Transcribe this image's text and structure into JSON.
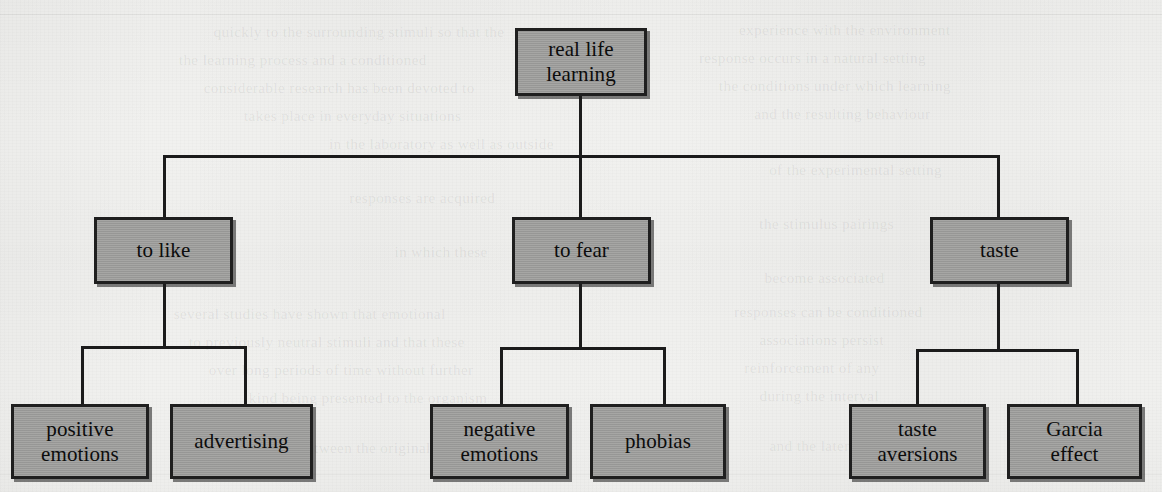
{
  "diagram": {
    "type": "hierarchy-tree",
    "levels": 3,
    "root": {
      "id": "real-life-learning",
      "label": "real life\nlearning"
    },
    "branches": [
      {
        "id": "to-like",
        "label": "to like",
        "children": [
          {
            "id": "positive-emotions",
            "label": "positive\nemotions"
          },
          {
            "id": "advertising",
            "label": "advertising"
          }
        ]
      },
      {
        "id": "to-fear",
        "label": "to fear",
        "children": [
          {
            "id": "negative-emotions",
            "label": "negative\nemotions"
          },
          {
            "id": "phobias",
            "label": "phobias"
          }
        ]
      },
      {
        "id": "taste",
        "label": "taste",
        "children": [
          {
            "id": "taste-aversions",
            "label": "taste\naversions"
          },
          {
            "id": "garcia-effect",
            "label": "Garcia\neffect"
          }
        ]
      }
    ]
  },
  "style": {
    "box_fill": "#9c9c9a",
    "box_border": "#1f1f1f",
    "line_color": "#1b1b1b",
    "text_color": "#0c0c0c",
    "page_background": "#f1f1ef"
  },
  "background_bleedthrough": [
    {
      "text": "quickly to the surrounding stimuli so that the",
      "x": 215,
      "y": 24
    },
    {
      "text": "experience with the environment",
      "x": 740,
      "y": 22
    },
    {
      "text": "the learning process and a conditioned",
      "x": 180,
      "y": 52
    },
    {
      "text": "response occurs in a natural setting",
      "x": 700,
      "y": 50
    },
    {
      "text": "considerable research has been devoted to",
      "x": 205,
      "y": 80
    },
    {
      "text": "the conditions under which learning",
      "x": 720,
      "y": 78
    },
    {
      "text": "takes place in everyday situations",
      "x": 245,
      "y": 108
    },
    {
      "text": "and the resulting behaviour",
      "x": 755,
      "y": 106
    },
    {
      "text": "in the laboratory as well as outside",
      "x": 330,
      "y": 136
    },
    {
      "text": "of the experimental setting",
      "x": 770,
      "y": 162
    },
    {
      "text": "responses are acquired",
      "x": 350,
      "y": 190
    },
    {
      "text": "the stimulus pairings",
      "x": 760,
      "y": 216
    },
    {
      "text": "in which these",
      "x": 395,
      "y": 244
    },
    {
      "text": "become associated",
      "x": 765,
      "y": 270
    },
    {
      "text": "several studies have shown that emotional",
      "x": 175,
      "y": 306
    },
    {
      "text": "responses can be conditioned",
      "x": 735,
      "y": 304
    },
    {
      "text": "to previously neutral stimuli and that these",
      "x": 190,
      "y": 334
    },
    {
      "text": "associations persist",
      "x": 760,
      "y": 332
    },
    {
      "text": "over long periods of time without further",
      "x": 210,
      "y": 362
    },
    {
      "text": "reinforcement of any",
      "x": 745,
      "y": 360
    },
    {
      "text": "kind being presented to the organism",
      "x": 250,
      "y": 390
    },
    {
      "text": "during the interval",
      "x": 760,
      "y": 388
    },
    {
      "text": "between the original conditioning",
      "x": 300,
      "y": 440
    },
    {
      "text": "and the later test",
      "x": 770,
      "y": 438
    }
  ]
}
